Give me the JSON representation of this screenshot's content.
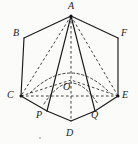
{
  "figure": {
    "kind": "geometry-diagram",
    "background_color": "#fbfbfa",
    "stroke_color": "#1a1a1a",
    "dash_color": "#2b2b2b",
    "labels": [
      {
        "id": "A",
        "text": "A",
        "x": 68,
        "y": 2
      },
      {
        "id": "B",
        "text": "B",
        "x": 13,
        "y": 28
      },
      {
        "id": "F",
        "text": "F",
        "x": 120,
        "y": 28
      },
      {
        "id": "C",
        "text": "C",
        "x": 7,
        "y": 92
      },
      {
        "id": "E",
        "text": "E",
        "x": 122,
        "y": 92
      },
      {
        "id": "O",
        "text": "O",
        "x": 63,
        "y": 84
      },
      {
        "id": "P",
        "text": "P",
        "x": 37,
        "y": 111
      },
      {
        "id": "Q",
        "text": "Q",
        "x": 91,
        "y": 111
      },
      {
        "id": "D",
        "text": "D",
        "x": 66,
        "y": 130
      }
    ],
    "points": [
      {
        "id": "A",
        "x": 71,
        "y": 16,
        "dot": true
      },
      {
        "id": "B",
        "x": 24,
        "y": 38,
        "dot": false
      },
      {
        "id": "F",
        "x": 118,
        "y": 38,
        "dot": false
      },
      {
        "id": "C",
        "x": 21,
        "y": 96,
        "dot": true
      },
      {
        "id": "E",
        "x": 118,
        "y": 96,
        "dot": true
      },
      {
        "id": "O",
        "x": 71,
        "y": 80,
        "dot": false
      },
      {
        "id": "P",
        "x": 47,
        "y": 111,
        "dot": false
      },
      {
        "id": "Q",
        "x": 95,
        "y": 111,
        "dot": false
      },
      {
        "id": "D",
        "x": 71,
        "y": 121,
        "dot": false
      }
    ],
    "solid_segments": [
      {
        "name": "A-B",
        "from": "A",
        "to": "B"
      },
      {
        "name": "A-F",
        "from": "A",
        "to": "F"
      },
      {
        "name": "B-C",
        "from": "B",
        "to": "C"
      },
      {
        "name": "F-E",
        "from": "F",
        "to": "E"
      },
      {
        "name": "C-P",
        "from": "C",
        "to": "P"
      },
      {
        "name": "P-D",
        "from": "P",
        "to": "D"
      },
      {
        "name": "D-Q",
        "from": "D",
        "to": "Q"
      },
      {
        "name": "Q-E",
        "from": "Q",
        "to": "E"
      },
      {
        "name": "A-P",
        "from": "A",
        "to": "P"
      },
      {
        "name": "A-Q",
        "from": "A",
        "to": "Q"
      }
    ],
    "dashed_segments": [
      {
        "name": "A-C",
        "from": "A",
        "to": "C"
      },
      {
        "name": "A-E",
        "from": "A",
        "to": "E"
      },
      {
        "name": "A-D",
        "from": "A",
        "to": "D"
      },
      {
        "name": "C-E",
        "from": "C",
        "to": "E"
      },
      {
        "name": "C-O",
        "from": "C",
        "to": "O"
      },
      {
        "name": "E-O",
        "from": "E",
        "to": "O"
      },
      {
        "name": "O-D",
        "from": "O",
        "to": "D"
      },
      {
        "name": "O-P",
        "from": "O",
        "to": "P"
      },
      {
        "name": "O-Q",
        "from": "O",
        "to": "Q"
      }
    ],
    "dashed_arcs": [
      {
        "name": "arc-P-to-Q-through-apex-foot",
        "d": "M 47 111 Q 71 58 95 111"
      },
      {
        "name": "arc-C-to-E-inner",
        "d": "M 25 95 Q 71 50 114 95"
      }
    ]
  }
}
